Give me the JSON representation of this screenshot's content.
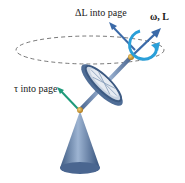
{
  "labels": {
    "delta_L": "ΔL into page",
    "omega_L": "ω, L",
    "tau": "τ into page"
  },
  "colors": {
    "orbit": "#555555",
    "rotation_arrow": "#2a9fd8",
    "L_arrow": "#3b6aa8",
    "dL_arrow": "#3b6aa8",
    "tau_arrow": "#1f9a7a",
    "metal": "#6d8bb0",
    "pivot": "#d9a030"
  }
}
